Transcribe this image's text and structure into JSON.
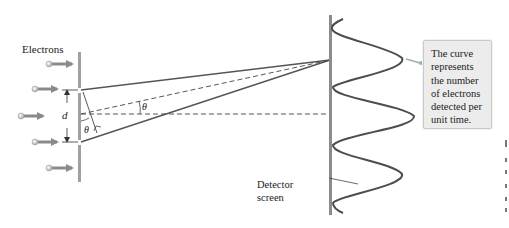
{
  "diagram": {
    "labels": {
      "electrons": "Electrons",
      "slit_separation": "d",
      "angle_upper": "θ",
      "angle_lower": "θ",
      "detector_line1": "Detector",
      "detector_line2": "screen"
    },
    "callout": {
      "lines": [
        "The curve",
        "represents",
        "the number",
        "of electrons",
        "detected per",
        "unit time."
      ]
    },
    "electron_beams": [
      {
        "y": 64,
        "x_start": 48,
        "x_end": 76
      },
      {
        "y": 89,
        "x_start": 35,
        "x_end": 61
      },
      {
        "y": 116,
        "x_start": 21,
        "x_end": 47
      },
      {
        "y": 142,
        "x_start": 35,
        "x_end": 61
      },
      {
        "y": 168,
        "x_start": 48,
        "x_end": 76
      }
    ],
    "barrier": {
      "x": 79,
      "y_top": 52,
      "y_bottom": 182,
      "slits": [
        90,
        142
      ]
    },
    "detector": {
      "x": 330,
      "y_top": 15,
      "y_bottom": 215
    },
    "intensity_curve": {
      "peaks_y": [
        58,
        116,
        174
      ],
      "minima_y": [
        29,
        87,
        145,
        203
      ],
      "peak_amplitudes": [
        73,
        85,
        73
      ],
      "min_amplitude": 2
    },
    "colors": {
      "lines": "#555555",
      "barrier": "#9a9a9a",
      "arrow": "#8a8a8a",
      "callout_bg": "#ececec",
      "callout_border": "#c9c9c9",
      "leader": "#9ab0b0"
    }
  }
}
